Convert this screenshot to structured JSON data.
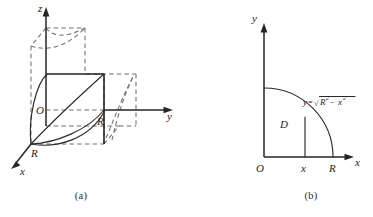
{
  "figure": {
    "panels": [
      {
        "id": "a",
        "caption": "(a)",
        "type": "3d-solid-sketch",
        "description": "Cylinder intersection solid in first octant with x, y, z axes",
        "axes": {
          "x_label": "x",
          "y_label": "y",
          "z_label": "z"
        },
        "origin_label": "O",
        "tick_labels": {
          "y_axis": "R",
          "x_axis": "R"
        }
      },
      {
        "id": "b",
        "caption": "(b)",
        "type": "2d-region-sketch",
        "description": "Quarter disk region D in the first quadrant bounded by the circle of radius R",
        "axes": {
          "x_label": "x",
          "y_label": "y"
        },
        "origin_label": "O",
        "region_label": "D",
        "tick_labels": {
          "x_variable": "x",
          "x_radius": "R"
        },
        "curve_equation": {
          "lhs": "y",
          "equals": "=",
          "radical_sign": "√",
          "radicand_first": "R",
          "radicand_first_exponent": "2",
          "minus": "−",
          "radicand_second": "x",
          "radicand_second_exponent": "2",
          "plain_text": "y=√(R²−x²)"
        }
      }
    ]
  },
  "colors": {
    "solid_stroke": "#2b2b2b",
    "dashed_stroke": "#6f6f6f",
    "axis_stroke": "#252525",
    "background": "#ffffff",
    "text": "#1d1d1d"
  }
}
